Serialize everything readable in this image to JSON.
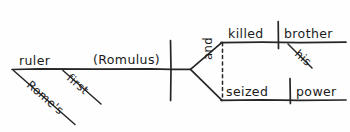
{
  "diagram": {
    "kind": "sentence-diagram",
    "style": "reed-kellogg-handwritten",
    "ink_color": "#262626",
    "paper_color": "#fefefe",
    "subject": {
      "head": "ruler",
      "appositive": "(Romulus)",
      "modifiers": [
        {
          "label": "Rome's",
          "type": "possessive-modifier"
        },
        {
          "label": "first",
          "type": "adjective-modifier"
        }
      ]
    },
    "compound_predicate": {
      "conjunction": "and",
      "branches": [
        {
          "verb": "killed",
          "direct_object": "brother",
          "object_modifier": "his"
        },
        {
          "verb": "seized",
          "direct_object": "power",
          "object_modifier": ""
        }
      ]
    }
  }
}
